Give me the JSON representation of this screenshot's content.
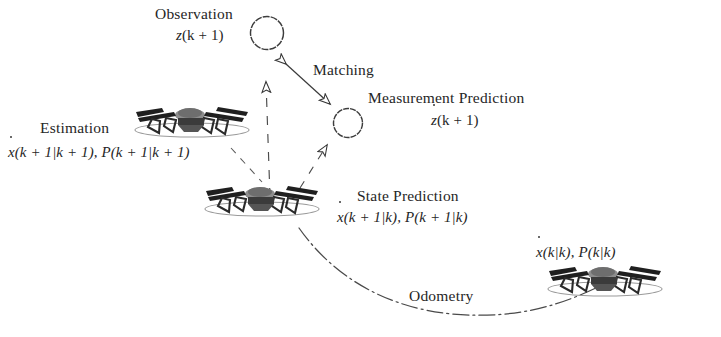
{
  "figure": {
    "background_color": "#ffffff",
    "ink_color": "#262626",
    "width": 721,
    "height": 337
  },
  "labels": {
    "observation": "Observation",
    "observation_symbol_z": "z",
    "observation_symbol_args": "(k + 1)",
    "matching": "Matching",
    "measurement_prediction": "Measurement Prediction",
    "measurement_prediction_symbol_z": "z",
    "measurement_prediction_symbol_args": "(k + 1)",
    "estimation": "Estimation",
    "estimation_symbol_x": "x",
    "estimation_symbol_x_args": "(k + 1|k + 1),",
    "estimation_symbol_p": "P",
    "estimation_symbol_p_args": "(k + 1|k + 1)",
    "state_prediction": "State Prediction",
    "state_prediction_symbol_x": "x",
    "state_prediction_symbol_x_args": "(k + 1|k),",
    "state_prediction_symbol_p": "P",
    "state_prediction_symbol_p_args": "(k + 1|k)",
    "odometry": "Odometry",
    "prior_symbol_x": "x",
    "prior_symbol_x_args": "(k|k),",
    "prior_symbol_p": "P",
    "prior_symbol_p_args": "(k|k)"
  },
  "nodes": {
    "observation_circle": {
      "cx": 267,
      "cy": 33,
      "r": 16.5
    },
    "measurement_prediction_circle": {
      "cx": 348,
      "cy": 123,
      "r": 14.5
    },
    "drone_estimation": {
      "cx": 192,
      "cy": 124
    },
    "drone_state_prediction": {
      "cx": 262,
      "cy": 203
    },
    "drone_prior": {
      "cx": 605,
      "cy": 283
    }
  },
  "connectors": {
    "matching_arrow": {
      "from": [
        283,
        61
      ],
      "to": [
        333,
        107
      ],
      "style": "double-headed-hollow"
    },
    "estimation_arrow": {
      "from": [
        268,
        196
      ],
      "to": [
        268,
        73
      ],
      "style": "dashed-hollow-arrow"
    },
    "measurement_arrow": {
      "from": [
        305,
        182
      ],
      "to": [
        330,
        140
      ],
      "style": "dashed-hollow-arrow"
    },
    "state_prediction_link": {
      "from": [
        235,
        150
      ],
      "to": [
        262,
        186
      ],
      "style": "dashed"
    },
    "odometry_curve": {
      "style": "dash-dot-curve"
    }
  }
}
